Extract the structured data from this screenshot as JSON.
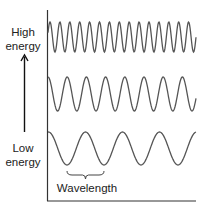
{
  "labels": {
    "high_line1": "High",
    "high_line2": "energy",
    "low_line1": "Low",
    "low_line2": "energy",
    "wavelength": "Wavelength"
  },
  "colors": {
    "wave": "#555555",
    "axis": "#333333",
    "text": "#222222",
    "background": "#ffffff"
  },
  "waves": [
    {
      "name": "high-energy-wave",
      "x_start": 48,
      "x_end": 196,
      "y_top": 22,
      "y_bottom": 52,
      "period": 9.9,
      "phase_x": 50
    },
    {
      "name": "medium-energy-wave",
      "x_start": 48,
      "x_end": 196,
      "y_top": 77,
      "y_bottom": 111,
      "period": 19.2,
      "phase_x": 48
    },
    {
      "name": "low-energy-wave",
      "x_start": 48,
      "x_end": 196,
      "y_top": 132,
      "y_bottom": 165,
      "period": 37,
      "phase_x": 85.5
    }
  ],
  "brace": {
    "x1": 67,
    "x2": 104,
    "y": 171
  }
}
